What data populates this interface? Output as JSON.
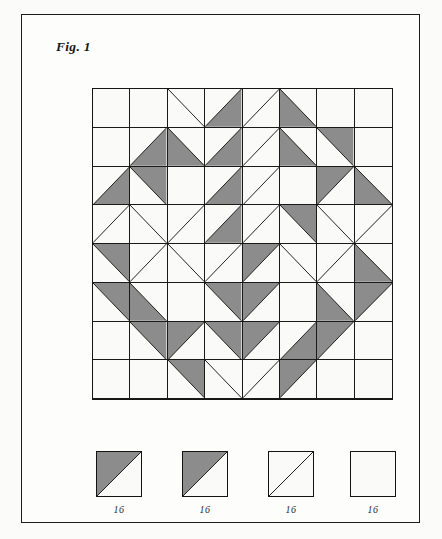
{
  "figure": {
    "label": "Fig. 1",
    "caption_label": "Fig. 1"
  },
  "colors": {
    "shaded": "#8c8c8c",
    "background": "#fafaf8",
    "line": "#1a1a1a",
    "frame": "#1c1c1c",
    "page": "#fbfbfa"
  },
  "quilt": {
    "rows": 8,
    "cols": 8,
    "cell_types_key": {
      "blank": "plain background square",
      "d1": "background square divided by diagonal from top-left to bottom-right",
      "d2": "background square divided by diagonal from top-right to bottom-left",
      "tl": "shaded triangle in top-left half (diagonal top-right to bottom-left)",
      "tr": "shaded triangle in top-right half (diagonal top-left to bottom-right)",
      "bl": "shaded triangle in bottom-left half (diagonal top-left to bottom-right)",
      "br": "shaded triangle in bottom-right half (diagonal top-right to bottom-left)"
    },
    "grid": [
      [
        "blank",
        "blank",
        "d1",
        "br",
        "d2",
        "bl",
        "blank",
        "blank"
      ],
      [
        "blank",
        "br",
        "bl",
        "br",
        "d2",
        "bl",
        "tr",
        "blank"
      ],
      [
        "br",
        "tr",
        "blank",
        "br",
        "d2",
        "blank",
        "tl",
        "bl"
      ],
      [
        "d2",
        "d1",
        "d2",
        "br",
        "d2",
        "tr",
        "d1",
        "d2"
      ],
      [
        "tr",
        "d2",
        "d1",
        "d2",
        "tl",
        "d1",
        "d2",
        "bl"
      ],
      [
        "tr",
        "bl",
        "blank",
        "tr",
        "tl",
        "blank",
        "bl",
        "tl"
      ],
      [
        "blank",
        "tr",
        "tl",
        "tr",
        "tl",
        "br",
        "tl",
        "blank"
      ],
      [
        "blank",
        "blank",
        "tr",
        "d1",
        "d2",
        "tl",
        "blank",
        "blank"
      ]
    ]
  },
  "legend": {
    "items": [
      {
        "name": "block-type-1",
        "type": "tl",
        "label": "16"
      },
      {
        "name": "block-type-2",
        "type": "tl",
        "label": "16"
      },
      {
        "name": "block-type-3",
        "type": "d2",
        "label": "16"
      },
      {
        "name": "block-type-4",
        "type": "blank",
        "label": "16"
      }
    ]
  }
}
